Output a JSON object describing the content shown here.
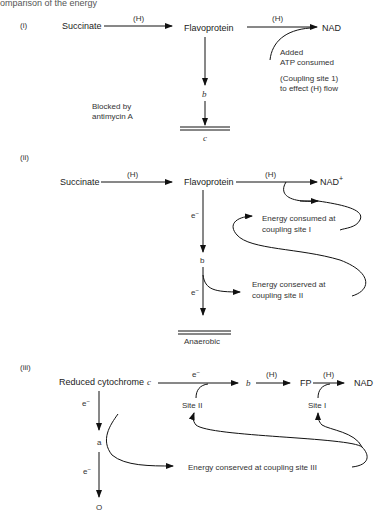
{
  "header": {
    "caption_partial": "omparison of the energy"
  },
  "panels": [
    {
      "label": "(i)",
      "nodes": {
        "succinate": "Succinate",
        "flavoprotein": "Flavoprotein",
        "nad": "NAD",
        "b": "b",
        "c": "c"
      },
      "edge_labels": {
        "h1": "(H)",
        "h2": "(H)"
      },
      "notes": {
        "atp_line1": "Added",
        "atp_line2": "ATP consumed",
        "coupling_line1": "(Coupling site 1)",
        "coupling_line2": "to effect (H) flow",
        "blocked_line1": "Blocked by",
        "blocked_line2": "antimycin A"
      }
    },
    {
      "label": "(ii)",
      "nodes": {
        "succinate": "Succinate",
        "flavoprotein": "Flavoprotein",
        "nad": "NAD",
        "nad_sup": "+",
        "b": "b",
        "anaerobic": "Anaerobic"
      },
      "edge_labels": {
        "h1": "(H)",
        "h2": "(H)",
        "e1": "e",
        "e1_sup": "−",
        "e2": "e",
        "e2_sup": "−"
      },
      "notes": {
        "consumed_line1": "Energy consumed at",
        "consumed_line2": "coupling site I",
        "conserved_line1": "Energy conserved at",
        "conserved_line2": "coupling site II"
      }
    },
    {
      "label": "(iii)",
      "nodes": {
        "cytc": "Reduced cytochrome",
        "cytc_italic": "c",
        "b": "b",
        "fp": "FP",
        "nad": "NAD",
        "a": "a",
        "o": "O",
        "site2": "Site II",
        "site1": "Site I"
      },
      "edge_labels": {
        "e_top": "e",
        "e_top_sup": "−",
        "h1": "(H)",
        "h2": "(H)",
        "e1": "e",
        "e1_sup": "−",
        "e2": "e",
        "e2_sup": "−"
      },
      "notes": {
        "conserved": "Energy conserved at coupling site III"
      }
    }
  ]
}
